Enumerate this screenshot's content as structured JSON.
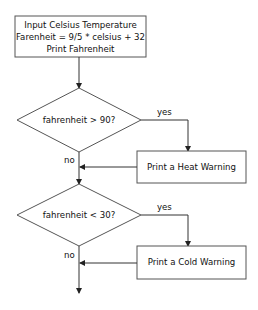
{
  "diagram": {
    "type": "flowchart",
    "nodes": {
      "start": {
        "lines": [
          "Input Celsius Temperature",
          "Farenheit = 9/5 * celsius + 32",
          "Print Fahrenheit"
        ]
      },
      "decision1": {
        "label": "fahrenheit > 90?"
      },
      "heat": {
        "label": "Print a Heat Warning"
      },
      "decision2": {
        "label": "fahrenheit < 30?"
      },
      "cold": {
        "label": "Print a Cold Warning"
      }
    },
    "edges": {
      "d1_yes": "yes",
      "d1_no": "no",
      "d2_yes": "yes",
      "d2_no": "no"
    },
    "colors": {
      "stroke": "#555555",
      "background": "#ffffff",
      "text": "#111111"
    }
  }
}
